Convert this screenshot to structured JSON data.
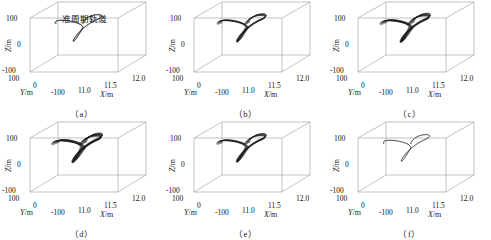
{
  "figure": {
    "rows": 2,
    "cols": 3,
    "background": "#ffffff",
    "line_color": "#1c1c1c",
    "box_color": "#9a9a9a"
  },
  "axes": {
    "xlabel": "X",
    "xunit": "/m",
    "ylabel": "Y",
    "yunit": "/m",
    "zlabel": "Z",
    "zunit": "/m",
    "xticks": [
      "11.0",
      "11.5",
      "12.0"
    ],
    "yticks": [
      "100",
      "0",
      "-100"
    ],
    "zticks": [
      "100",
      "0",
      "-100"
    ],
    "xlim": [
      10.8,
      12.0
    ],
    "ylim": [
      -100,
      100
    ],
    "zlim": [
      -100,
      100
    ]
  },
  "annotation": {
    "text": "准周期轨道",
    "panel": "a"
  },
  "panels": [
    {
      "id": "a",
      "caption": "（a）",
      "windings": 3,
      "spread": 0.1,
      "has_annotation": true
    },
    {
      "id": "b",
      "caption": "（b）",
      "windings": 9,
      "spread": 0.38,
      "has_annotation": false
    },
    {
      "id": "c",
      "caption": "（c）",
      "windings": 12,
      "spread": 0.55,
      "has_annotation": false
    },
    {
      "id": "d",
      "caption": "（d）",
      "windings": 14,
      "spread": 0.62,
      "has_annotation": false
    },
    {
      "id": "e",
      "caption": "（e）",
      "windings": 10,
      "spread": 0.45,
      "has_annotation": false
    },
    {
      "id": "f",
      "caption": "（f）",
      "windings": 1,
      "spread": 0.0,
      "has_annotation": false
    }
  ],
  "chart_data": {
    "type": "line",
    "title": "",
    "xlabel": "X/m",
    "ylabel": "Y/m",
    "zlabel": "Z/m",
    "xlim": [
      10.8,
      12.0
    ],
    "ylim": [
      -100,
      100
    ],
    "zlim": [
      -100,
      100
    ],
    "xticks": [
      "11.0",
      "11.5",
      "12.0"
    ],
    "yticks": [
      "100",
      "0",
      "-100"
    ],
    "zticks": [
      "100",
      "0",
      "-100"
    ],
    "grid": false,
    "legend": "none",
    "projection": "3d",
    "annotations": [
      {
        "text": "准周期轨道",
        "panel": "a"
      }
    ],
    "series": [
      {
        "name": "(a)",
        "windings": 3,
        "spread": 0.1,
        "description": "thin quasi-periodic orbit tube"
      },
      {
        "name": "(b)",
        "windings": 9,
        "spread": 0.38,
        "description": "quasi-periodic orbit bundle"
      },
      {
        "name": "(c)",
        "windings": 12,
        "spread": 0.55,
        "description": "wide quasi-periodic orbit bundle"
      },
      {
        "name": "(d)",
        "windings": 14,
        "spread": 0.62,
        "description": "dense quasi-periodic orbit bundle"
      },
      {
        "name": "(e)",
        "windings": 10,
        "spread": 0.45,
        "description": "quasi-periodic orbit bundle"
      },
      {
        "name": "(f)",
        "windings": 1,
        "spread": 0.0,
        "description": "single closed periodic orbit"
      }
    ]
  }
}
